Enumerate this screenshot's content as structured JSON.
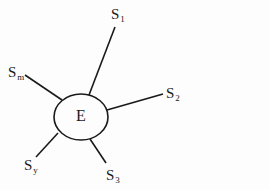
{
  "diagram": {
    "type": "star",
    "center": {
      "label": "E",
      "shape": "ellipse",
      "cx": 81,
      "cy": 117,
      "rx": 27,
      "ry": 23
    },
    "nodes": [
      {
        "id": "s1",
        "base": "S",
        "sub": "1",
        "x1": 89,
        "y1": 95,
        "x2": 115,
        "y2": 27,
        "lx": 111,
        "ly": 7
      },
      {
        "id": "s2",
        "base": "S",
        "sub": "2",
        "x1": 107,
        "y1": 110,
        "x2": 163,
        "y2": 94,
        "lx": 166,
        "ly": 86
      },
      {
        "id": "sm",
        "base": "S",
        "sub": "m",
        "x1": 62,
        "y1": 100,
        "x2": 25,
        "y2": 75,
        "lx": 8,
        "ly": 65
      },
      {
        "id": "sy",
        "base": "S",
        "sub": "y",
        "x1": 58,
        "y1": 133,
        "x2": 36,
        "y2": 157,
        "lx": 24,
        "ly": 158
      },
      {
        "id": "s3",
        "base": "S",
        "sub": "3",
        "x1": 90,
        "y1": 139,
        "x2": 106,
        "y2": 163,
        "lx": 106,
        "ly": 168
      }
    ],
    "stroke_color": "#1a1a1a"
  }
}
